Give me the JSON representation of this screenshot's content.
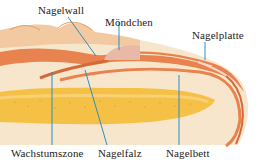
{
  "diagram": {
    "labels": {
      "nagelwall": "Nagelwall",
      "moendchen": "Möndchen",
      "nagelplatte": "Nagelplatte",
      "wachstumszone": "Wachstumszone",
      "nagelfalz": "Nagelfalz",
      "nagelbett": "Nagelbett"
    },
    "colors": {
      "skin_light": "#f7e6cc",
      "skin_mid": "#f2c9a0",
      "tissue_orange": "#e8824e",
      "tissue_dark": "#d4693a",
      "bone_yellow": "#f5c046",
      "bone_light": "#f9d98a",
      "nail_pink": "#e9b9a8",
      "leader_line": "#2a8fc4"
    }
  }
}
